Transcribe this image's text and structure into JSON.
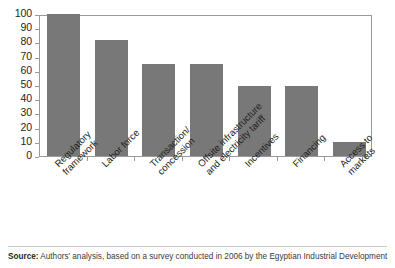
{
  "chart_data": {
    "type": "bar",
    "title": "",
    "subtitle": "",
    "xlabel": "",
    "ylabel": "",
    "ylim": [
      0,
      100
    ],
    "yticks": [
      0,
      10,
      20,
      30,
      40,
      50,
      60,
      70,
      80,
      90,
      100
    ],
    "grid": false,
    "legend": "none",
    "bar_color": "#787878",
    "categories": [
      "Regulatory framework",
      "Labor force",
      "Transaction/ concession",
      "Offsite infrastructure and electricity tariff",
      "Incentives",
      "Financing",
      "Access to markets"
    ],
    "category_lines": [
      [
        "Regulatory",
        "framework"
      ],
      [
        "Labor force",
        ""
      ],
      [
        "Transaction/",
        "concession"
      ],
      [
        "Offsite infrastructure",
        "and electricity tariff"
      ],
      [
        "Incentives",
        ""
      ],
      [
        "Financing",
        ""
      ],
      [
        "Access to",
        "markets"
      ]
    ],
    "values": [
      100,
      82,
      65,
      65,
      49,
      49,
      10
    ]
  },
  "source": {
    "label": "Source:",
    "text": " Authors’ analysis, based on a survey conducted in 2006 by the Egyptian Industrial Development"
  }
}
